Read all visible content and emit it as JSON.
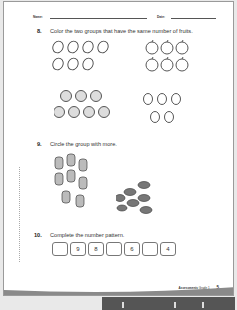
{
  "header": {
    "name_label": "Name:",
    "date_label": "Date:"
  },
  "questions": [
    {
      "number": "8.",
      "prompt": "Color the two groups that have the same number of fruits.",
      "groups": [
        {
          "fruit": "mango",
          "count": 7
        },
        {
          "fruit": "apple",
          "count": 6
        },
        {
          "fruit": "strawberry",
          "count": 7
        },
        {
          "fruit": "pear",
          "count": 5
        }
      ]
    },
    {
      "number": "9.",
      "prompt": "Circle the group with more.",
      "groups": [
        {
          "item": "teddy bear",
          "count": 8
        },
        {
          "item": "bat",
          "count": 7
        }
      ]
    },
    {
      "number": "10.",
      "prompt": "Complete the number pattern.",
      "boxes": [
        "",
        "9",
        "8",
        "",
        "6",
        "",
        "4"
      ]
    }
  ],
  "footer": {
    "section": "Assessments",
    "grade": "Grade 1",
    "page": "5"
  },
  "colors": {
    "page": "#ffffff",
    "background": "#e9e9e9",
    "swoosh": "#8a8a8a",
    "bar": "#555555"
  }
}
